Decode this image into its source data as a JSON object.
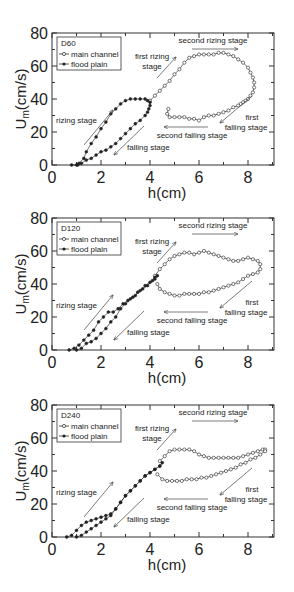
{
  "chart_data": [
    {
      "type": "scatter",
      "title": "D60",
      "xlabel": "h(cm)",
      "ylabel": "Um(cm/s)",
      "xlim": [
        0,
        9
      ],
      "ylim": [
        0,
        80
      ],
      "xticks": [
        "0",
        "2",
        "4",
        "6",
        "8"
      ],
      "yticks": [
        "0",
        "20",
        "40",
        "60",
        "80"
      ],
      "legend": {
        "title": "D60",
        "entries": [
          "main channel",
          "flood plain"
        ],
        "position": "upper-left"
      },
      "annotations": [
        "rizing stage",
        "falling stage",
        "first rizing stage",
        "second rizing stage",
        "first falling stage",
        "second falling stage"
      ],
      "series": [
        {
          "name": "main channel",
          "marker": "open-circle",
          "x": [
            4.0,
            4.2,
            4.4,
            4.6,
            4.8,
            5.0,
            5.2,
            5.4,
            5.6,
            5.8,
            6.0,
            6.2,
            6.4,
            6.6,
            6.8,
            7.0,
            7.2,
            7.4,
            7.6,
            7.8,
            8.0,
            8.1,
            8.2,
            8.25,
            8.25,
            8.2,
            8.1,
            8.0,
            7.9,
            7.8,
            7.7,
            7.6,
            7.4,
            7.2,
            7.0,
            6.8,
            6.6,
            6.4,
            6.2,
            6.0,
            5.8,
            5.6,
            5.4,
            5.2,
            5.0,
            4.8,
            4.7,
            4.75
          ],
          "y": [
            39,
            42,
            45,
            48,
            51,
            55,
            58,
            62,
            65,
            66,
            67,
            67,
            67,
            67,
            68,
            68,
            67,
            66,
            64,
            62,
            59,
            56,
            53,
            50,
            47,
            44,
            42,
            40,
            39,
            38,
            37,
            36,
            35,
            33,
            32,
            31,
            30,
            30,
            29,
            27,
            28,
            28,
            29,
            29,
            29,
            29,
            31,
            34
          ]
        },
        {
          "name": "flood plain",
          "marker": "filled-circle",
          "x": [
            0.8,
            1.0,
            1.1,
            1.3,
            1.4,
            1.6,
            1.8,
            2.0,
            2.2,
            2.4,
            2.6,
            2.8,
            3.0,
            3.2,
            3.4,
            3.6,
            3.8,
            3.9,
            4.0,
            4.0,
            3.95,
            3.9,
            3.8,
            3.6,
            3.4,
            3.2,
            3.0,
            2.8,
            2.6,
            2.4,
            2.2,
            2.0,
            1.8,
            1.6,
            1.4,
            1.2,
            1.05
          ],
          "y": [
            0,
            0,
            1,
            4,
            8,
            13,
            17,
            22,
            26,
            31,
            34,
            37,
            39,
            40,
            40,
            40,
            40,
            39,
            38,
            36,
            34,
            32,
            30,
            27,
            25,
            22,
            19,
            16,
            13,
            11,
            9,
            8,
            6,
            4,
            3,
            1,
            0
          ]
        }
      ]
    },
    {
      "type": "scatter",
      "title": "D120",
      "xlabel": "h(cm)",
      "ylabel": "Um(cm/s)",
      "xlim": [
        0,
        9
      ],
      "ylim": [
        0,
        80
      ],
      "xticks": [
        "0",
        "2",
        "4",
        "6",
        "8"
      ],
      "yticks": [
        "0",
        "20",
        "40",
        "60",
        "80"
      ],
      "legend": {
        "title": "D120",
        "entries": [
          "main channel",
          "flood plain"
        ],
        "position": "upper-left"
      },
      "annotations": [
        "rizing stage",
        "falling stage",
        "first rizing stage",
        "second rizing stage",
        "first falling stage",
        "second falling stage"
      ],
      "series": [
        {
          "name": "main channel",
          "marker": "open-circle",
          "x": [
            4.2,
            4.4,
            4.6,
            4.8,
            5.0,
            5.2,
            5.4,
            5.6,
            5.8,
            6.0,
            6.2,
            6.4,
            6.6,
            6.8,
            7.0,
            7.2,
            7.4,
            7.6,
            7.8,
            8.0,
            8.2,
            8.4,
            8.5,
            8.5,
            8.4,
            8.2,
            8.0,
            7.8,
            7.6,
            7.4,
            7.2,
            7.0,
            6.8,
            6.6,
            6.4,
            6.2,
            6.0,
            5.8,
            5.6,
            5.4,
            5.2,
            5.0,
            4.8,
            4.6,
            4.4,
            4.3
          ],
          "y": [
            45,
            49,
            52,
            55,
            57,
            58,
            59,
            59,
            58,
            59,
            60,
            59,
            58,
            57,
            56,
            55,
            54,
            54,
            55,
            56,
            55,
            54,
            52,
            49,
            47,
            46,
            45,
            43,
            41,
            40,
            39,
            38,
            37,
            36,
            35,
            35,
            34,
            34,
            34,
            34,
            33,
            33,
            34,
            35,
            37,
            40
          ]
        },
        {
          "name": "flood plain",
          "marker": "filled-circle",
          "x": [
            0.7,
            0.9,
            1.1,
            1.3,
            1.5,
            1.7,
            1.9,
            2.1,
            2.3,
            2.5,
            2.7,
            2.9,
            3.1,
            3.3,
            3.5,
            3.7,
            3.9,
            4.1,
            4.2,
            4.3,
            4.2,
            4.0,
            3.8,
            3.6,
            3.4,
            3.2,
            3.0,
            2.8,
            2.6,
            2.4,
            2.2,
            2.0,
            1.8,
            1.6,
            1.4,
            1.2,
            1.0
          ],
          "y": [
            0,
            1,
            3,
            6,
            9,
            12,
            17,
            20,
            23,
            23,
            25,
            28,
            30,
            32,
            35,
            37,
            39,
            42,
            44,
            45,
            43,
            41,
            39,
            36,
            33,
            31,
            28,
            25,
            20,
            17,
            13,
            10,
            7,
            5,
            4,
            1,
            0
          ]
        }
      ]
    },
    {
      "type": "scatter",
      "title": "D240",
      "xlabel": "h(cm)",
      "ylabel": "Um(cm/s)",
      "xlim": [
        0,
        9
      ],
      "ylim": [
        0,
        80
      ],
      "xticks": [
        "0",
        "2",
        "4",
        "6",
        "8"
      ],
      "yticks": [
        "0",
        "20",
        "40",
        "60",
        "80"
      ],
      "legend": {
        "title": "D240",
        "entries": [
          "main channel",
          "flood plain"
        ],
        "position": "upper-left"
      },
      "annotations": [
        "rizing stage",
        "falling stage",
        "first rizing stage",
        "second rizing stage",
        "first falling stage",
        "second falling stage"
      ],
      "series": [
        {
          "name": "main channel",
          "marker": "open-circle",
          "x": [
            4.4,
            4.6,
            4.8,
            5.0,
            5.2,
            5.4,
            5.6,
            5.8,
            6.0,
            6.2,
            6.4,
            6.6,
            6.8,
            7.0,
            7.2,
            7.4,
            7.6,
            7.8,
            8.0,
            8.2,
            8.4,
            8.6,
            8.7,
            8.7,
            8.5,
            8.3,
            8.1,
            7.9,
            7.7,
            7.5,
            7.3,
            7.1,
            6.9,
            6.7,
            6.5,
            6.3,
            6.1,
            5.9,
            5.7,
            5.5,
            5.3,
            5.1,
            4.9,
            4.7,
            4.5,
            4.3
          ],
          "y": [
            46,
            49,
            52,
            53,
            53,
            53,
            53,
            52,
            50,
            49,
            48,
            48,
            48,
            48,
            48,
            48,
            48,
            49,
            50,
            51,
            52,
            53,
            53,
            52,
            50,
            48,
            47,
            45,
            44,
            42,
            41,
            40,
            39,
            38,
            37,
            36,
            36,
            35,
            35,
            35,
            34,
            34,
            34,
            34,
            35,
            38
          ]
        },
        {
          "name": "flood plain",
          "marker": "filled-circle",
          "x": [
            0.6,
            0.8,
            1.0,
            1.2,
            1.4,
            1.6,
            1.8,
            2.0,
            2.2,
            2.4,
            2.6,
            2.8,
            3.0,
            3.2,
            3.4,
            3.6,
            3.8,
            4.0,
            4.2,
            4.4,
            4.5,
            4.4,
            4.2,
            4.0,
            3.8,
            3.6,
            3.4,
            3.2,
            3.0,
            2.8,
            2.6,
            2.4,
            2.2,
            2.0,
            1.8,
            1.6,
            1.4,
            1.2,
            1.0
          ],
          "y": [
            0,
            1,
            4,
            7,
            9,
            10,
            11,
            12,
            13,
            14,
            17,
            21,
            25,
            28,
            31,
            34,
            37,
            39,
            41,
            43,
            45,
            43,
            41,
            39,
            37,
            34,
            31,
            28,
            25,
            21,
            17,
            13,
            11,
            9,
            7,
            5,
            3,
            1,
            0
          ]
        }
      ]
    }
  ],
  "panels": [
    {
      "id": "D60",
      "legend_title": "D60",
      "legend_main": "main channel",
      "legend_flood": "flood plain",
      "xlabel": "h(cm)",
      "ylabel": "U",
      "ylabel_sub": "m",
      "ylabel_unit": "(cm/s)",
      "labels": {
        "rizing": "rizing stage",
        "falling": "falling stage",
        "first_rizing_1": "first rizing",
        "first_rizing_2": "stage",
        "second_rizing": "second rizing stage",
        "first_falling_1": "first",
        "first_falling_2": "falling stage",
        "second_falling": "second falling stage"
      }
    },
    {
      "id": "D120",
      "legend_title": "D120",
      "legend_main": "main channel",
      "legend_flood": "flood plain",
      "xlabel": "h(cm)",
      "ylabel": "U",
      "ylabel_sub": "m",
      "ylabel_unit": "(cm/s)",
      "labels": {
        "rizing": "rizing stage",
        "falling": "falling stage",
        "first_rizing_1": "first rizing",
        "first_rizing_2": "stage",
        "second_rizing": "second rizing stage",
        "first_falling_1": "first",
        "first_falling_2": "falling stage",
        "second_falling": "second falling stage"
      }
    },
    {
      "id": "D240",
      "legend_title": "D240",
      "legend_main": "main channel",
      "legend_flood": "flood plain",
      "xlabel": "h(cm)",
      "ylabel": "U",
      "ylabel_sub": "m",
      "ylabel_unit": "(cm/s)",
      "labels": {
        "rizing": "rizing stage",
        "falling": "falling stage",
        "first_rizing_1": "first rizing",
        "first_rizing_2": "stage",
        "second_rizing": "second rizing stage",
        "first_falling_1": "first",
        "first_falling_2": "falling stage",
        "second_falling": "second falling stage"
      }
    }
  ],
  "ticks": {
    "x": [
      "0",
      "2",
      "4",
      "6",
      "8"
    ],
    "y": [
      "0",
      "20",
      "40",
      "60",
      "80"
    ]
  },
  "colors": {
    "axis": "#333333",
    "marker": "#222222",
    "arrow": "#444444",
    "background": "#ffffff"
  }
}
